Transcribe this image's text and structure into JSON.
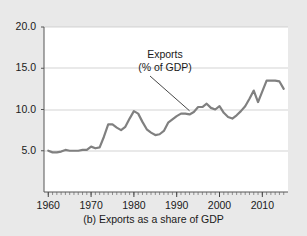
{
  "chart_data": {
    "type": "line",
    "title": "",
    "caption": "(b) Exports as a share of GDP",
    "xlabel": "",
    "ylabel": "",
    "xlim": [
      1959,
      2016
    ],
    "ylim": [
      0.0,
      20.0
    ],
    "grid": true,
    "grid_axis": "y",
    "legend": "none",
    "ytick_labels": [
      "20.0",
      "15.0",
      "10.0",
      "5.0"
    ],
    "ytick_values": [
      20.0,
      15.0,
      10.0,
      5.0
    ],
    "xtick_labels": [
      "1960",
      "1970",
      "1980",
      "1990",
      "2000",
      "2010"
    ],
    "xtick_values": [
      1960,
      1970,
      1980,
      1990,
      2000,
      2010
    ],
    "minor_xticks_every": 1,
    "line_color": "#808080",
    "annotations": [
      {
        "text_line1": "Exports",
        "text_line2": "(% of GDP)",
        "points_to_year": 1993,
        "points_to_value": 9.6
      }
    ],
    "series": [
      {
        "name": "Exports (% of GDP)",
        "x": [
          1960,
          1961,
          1962,
          1963,
          1964,
          1965,
          1966,
          1967,
          1968,
          1969,
          1970,
          1971,
          1972,
          1973,
          1974,
          1975,
          1976,
          1977,
          1978,
          1979,
          1980,
          1981,
          1982,
          1983,
          1984,
          1985,
          1986,
          1987,
          1988,
          1989,
          1990,
          1991,
          1992,
          1993,
          1994,
          1995,
          1996,
          1997,
          1998,
          1999,
          2000,
          2001,
          2002,
          2003,
          2004,
          2005,
          2006,
          2007,
          2008,
          2009,
          2010,
          2011,
          2012,
          2013,
          2014,
          2015
        ],
        "values": [
          5.0,
          4.8,
          4.8,
          4.9,
          5.1,
          5.0,
          5.0,
          5.0,
          5.1,
          5.1,
          5.5,
          5.3,
          5.4,
          6.7,
          8.2,
          8.2,
          7.8,
          7.5,
          7.9,
          8.9,
          9.8,
          9.5,
          8.5,
          7.6,
          7.2,
          6.9,
          7.0,
          7.4,
          8.4,
          8.8,
          9.2,
          9.5,
          9.5,
          9.4,
          9.7,
          10.3,
          10.3,
          10.7,
          10.2,
          10.0,
          10.4,
          9.6,
          9.1,
          8.9,
          9.3,
          9.8,
          10.4,
          11.3,
          12.3,
          10.9,
          12.2,
          13.5,
          13.5,
          13.5,
          13.4,
          12.5
        ]
      }
    ]
  }
}
